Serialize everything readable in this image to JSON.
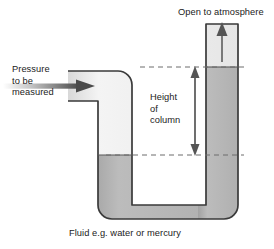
{
  "figure": {
    "title_caption": "Fluid e.g. water or mercury",
    "labels": {
      "pressure_line1": "Pressure",
      "pressure_line2": "to be",
      "pressure_line3": "measured",
      "height_line1": "Height",
      "height_line2": "of",
      "height_line3": "column",
      "open_to_atmosphere": "Open to atmosphere"
    },
    "colors": {
      "fluid": "#b2b2b2",
      "gas": "#efefef",
      "tube_outline": "#3a3a3a",
      "dashed_line": "#6d6d6d",
      "arrow": "#555555",
      "text": "#222222",
      "background": "#ffffff"
    },
    "geometry": {
      "left_tube_x": 98,
      "left_tube_width": 34,
      "right_tube_x": 206,
      "right_tube_width": 32,
      "inlet_y": 71,
      "inlet_height": 30,
      "bottom_y": 219,
      "left_fluid_level_y": 155,
      "right_fluid_level_y": 67,
      "dashed_upper_y": 67,
      "dashed_lower_y": 155,
      "height_arrow_x": 195
    }
  }
}
